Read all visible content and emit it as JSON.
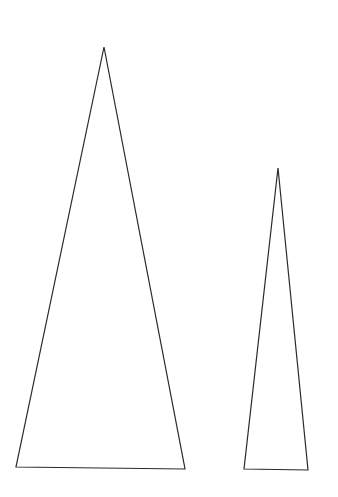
{
  "diagram": {
    "background": "#ffffff",
    "stroke": "#2a2a2a",
    "shapes": [
      {
        "name": "large-triangle",
        "points": "104,47 16,467 185,469"
      },
      {
        "name": "small-triangle",
        "points": "278,168 244,469 308,470"
      }
    ]
  }
}
